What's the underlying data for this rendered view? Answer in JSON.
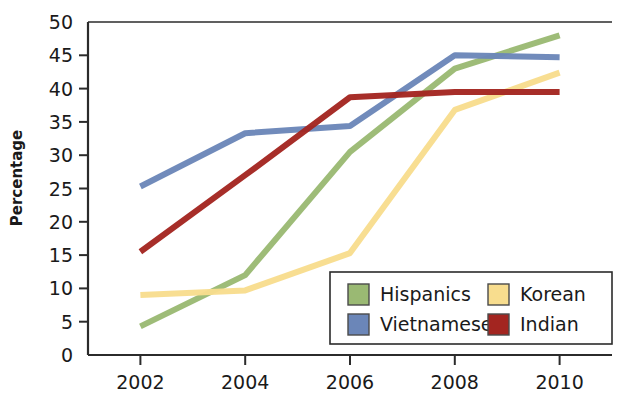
{
  "chart_data": {
    "type": "line",
    "title": "",
    "xlabel": "",
    "ylabel": "Percentage",
    "x": [
      2002,
      2004,
      2006,
      2008,
      2010
    ],
    "xtick_labels": [
      "2002",
      "2004",
      "2006",
      "2008",
      "2010"
    ],
    "ytick_labels": [
      "0",
      "5",
      "10",
      "15",
      "20",
      "25",
      "30",
      "35",
      "40",
      "45",
      "50"
    ],
    "ytick_values": [
      0,
      5,
      10,
      15,
      20,
      25,
      30,
      35,
      40,
      45,
      50
    ],
    "ylim": [
      0,
      50
    ],
    "xlim": [
      2001,
      2011
    ],
    "grid": false,
    "legend_position": "lower right",
    "series": [
      {
        "name": "Hispanics",
        "color": "#9ab973",
        "values": [
          4.3,
          12.0,
          30.5,
          43.0,
          48.0
        ]
      },
      {
        "name": "Vietnamese",
        "color": "#6b86b8",
        "values": [
          25.3,
          33.3,
          34.4,
          45.0,
          44.7
        ]
      },
      {
        "name": "Korean",
        "color": "#f8dd8e",
        "values": [
          9.0,
          9.7,
          15.3,
          36.8,
          42.4
        ]
      },
      {
        "name": "Indian",
        "color": "#a32520",
        "values": [
          15.5,
          27.0,
          38.7,
          39.5,
          39.5
        ]
      }
    ]
  },
  "legend": {
    "entries": [
      {
        "label": "Hispanics",
        "color": "#9ab973"
      },
      {
        "label": "Korean",
        "color": "#f8dd8e"
      },
      {
        "label": "Vietnamese",
        "color": "#6b86b8"
      },
      {
        "label": "Indian",
        "color": "#a32520"
      }
    ]
  },
  "axes": {
    "y_title": "Percentage"
  },
  "colors": {
    "axis": "#2b2b2b",
    "text": "#1a1a1a",
    "background": "#ffffff"
  }
}
